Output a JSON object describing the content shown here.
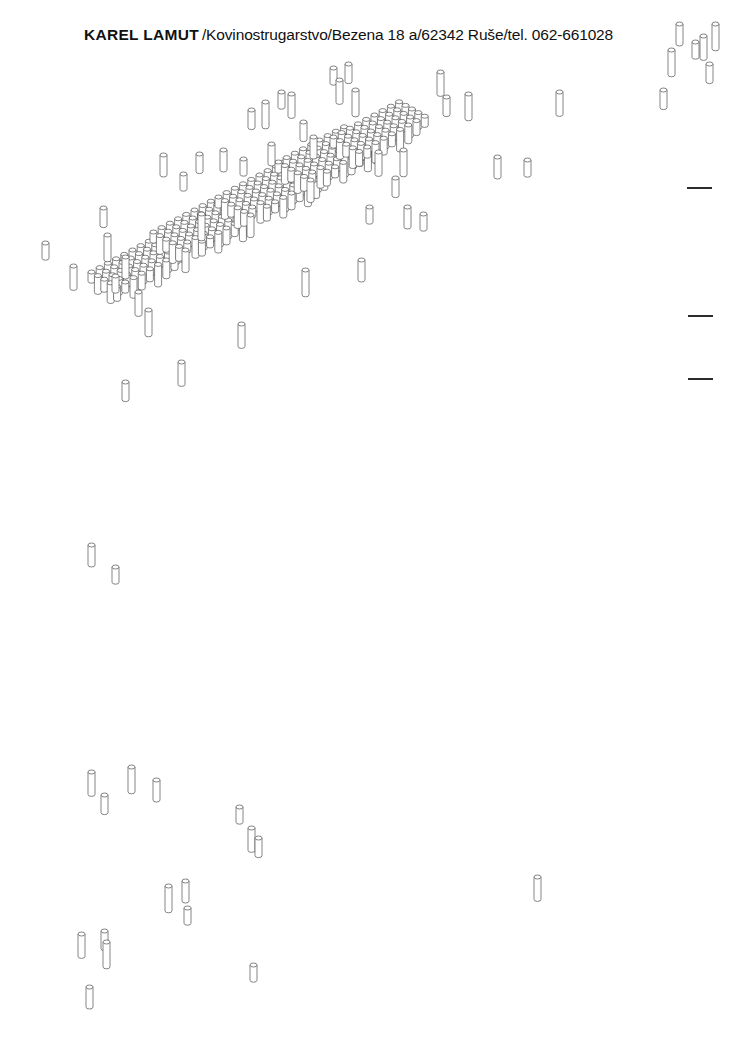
{
  "document": {
    "kind": "scanned-letterhead-artwork",
    "background_color": "#ffffff",
    "ink_color": "#1a1a1a"
  },
  "letterhead": {
    "brand": "KAREL LAMUT",
    "details": "/Kovinostrugarstvo/Bezena 18 a/62342 Ruše/tel. 062-661028",
    "full_line": "KAREL LAMUT /Kovinostrugarstvo/Bezena 18 a/62342 Ruše/tel. 062-661028"
  },
  "artwork": {
    "title": "isometric-rod-lettering",
    "description": "Axonometric line drawing: dense lattices of small cylindrical rods assembled into stylized letterforms, surrounded by scattered individual rods.",
    "stroke_color": "#3a3a3a",
    "fill_color": "#ffffff",
    "rod": {
      "width": 7,
      "height": 24,
      "cap_height": 4
    },
    "clusters": [
      {
        "name": "cluster-left",
        "x": 88,
        "y": 270,
        "cols": 9,
        "rows": 5,
        "depth": 5
      },
      {
        "name": "cluster-mid-left",
        "x": 150,
        "y": 230,
        "cols": 8,
        "rows": 6,
        "depth": 6
      },
      {
        "name": "cluster-center",
        "x": 215,
        "y": 195,
        "cols": 10,
        "rows": 6,
        "depth": 6
      },
      {
        "name": "cluster-mid-right",
        "x": 275,
        "y": 160,
        "cols": 9,
        "rows": 6,
        "depth": 6
      },
      {
        "name": "cluster-right",
        "x": 330,
        "y": 135,
        "cols": 9,
        "rows": 5,
        "depth": 6
      }
    ],
    "scattered_rods": [
      [
        42,
        241
      ],
      [
        70,
        264
      ],
      [
        100,
        206
      ],
      [
        104,
        233
      ],
      [
        122,
        255
      ],
      [
        112,
        274
      ],
      [
        135,
        290
      ],
      [
        122,
        380
      ],
      [
        145,
        308
      ],
      [
        160,
        153
      ],
      [
        180,
        172
      ],
      [
        178,
        360
      ],
      [
        196,
        152
      ],
      [
        198,
        212
      ],
      [
        220,
        148
      ],
      [
        240,
        157
      ],
      [
        238,
        322
      ],
      [
        248,
        108
      ],
      [
        262,
        100
      ],
      [
        268,
        142
      ],
      [
        278,
        90
      ],
      [
        288,
        92
      ],
      [
        300,
        120
      ],
      [
        302,
        268
      ],
      [
        310,
        135
      ],
      [
        330,
        66
      ],
      [
        336,
        78
      ],
      [
        345,
        62
      ],
      [
        352,
        88
      ],
      [
        358,
        258
      ],
      [
        366,
        205
      ],
      [
        375,
        150
      ],
      [
        392,
        176
      ],
      [
        400,
        148
      ],
      [
        404,
        205
      ],
      [
        420,
        212
      ],
      [
        437,
        70
      ],
      [
        443,
        95
      ],
      [
        465,
        92
      ],
      [
        494,
        155
      ],
      [
        524,
        158
      ],
      [
        556,
        90
      ],
      [
        660,
        88
      ],
      [
        668,
        48
      ],
      [
        676,
        22
      ],
      [
        692,
        40
      ],
      [
        700,
        34
      ],
      [
        706,
        62
      ],
      [
        712,
        22
      ],
      [
        88,
        543
      ],
      [
        112,
        565
      ],
      [
        88,
        770
      ],
      [
        101,
        793
      ],
      [
        128,
        765
      ],
      [
        153,
        778
      ],
      [
        236,
        805
      ],
      [
        248,
        826
      ],
      [
        255,
        836
      ],
      [
        165,
        884
      ],
      [
        182,
        879
      ],
      [
        184,
        906
      ],
      [
        78,
        932
      ],
      [
        101,
        929
      ],
      [
        103,
        940
      ],
      [
        86,
        985
      ],
      [
        250,
        963
      ],
      [
        534,
        875
      ]
    ],
    "margin_dashes": [
      {
        "name": "dash-1",
        "x": 687,
        "y": 187,
        "width": 25
      },
      {
        "name": "dash-2",
        "x": 688,
        "y": 315,
        "width": 25
      },
      {
        "name": "dash-3",
        "x": 688,
        "y": 378,
        "width": 25
      }
    ]
  }
}
